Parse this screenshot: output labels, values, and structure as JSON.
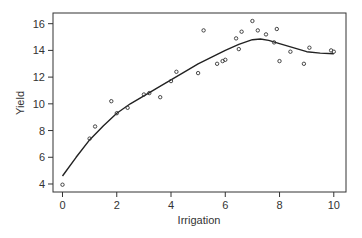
{
  "chart_data": {
    "type": "scatter",
    "title": "",
    "xlabel": "Irrigation",
    "ylabel": "Yield",
    "xlim": [
      -0.35,
      10.45
    ],
    "ylim": [
      3.4,
      16.8
    ],
    "xticks": [
      0,
      2,
      4,
      6,
      8,
      10
    ],
    "yticks": [
      4,
      6,
      8,
      10,
      12,
      14,
      16
    ],
    "grid": false,
    "legend": null,
    "series": [
      {
        "name": "observations",
        "kind": "points",
        "marker": "open-circle",
        "x": [
          0,
          1.0,
          1.2,
          1.8,
          2.0,
          2.4,
          3.0,
          3.2,
          3.6,
          4.0,
          4.2,
          5.0,
          5.2,
          5.7,
          5.9,
          6.0,
          6.4,
          6.5,
          6.6,
          7.0,
          7.2,
          7.5,
          7.8,
          7.9,
          8.0,
          8.4,
          8.9,
          9.1,
          9.9,
          10.0
        ],
        "y": [
          3.95,
          7.4,
          8.3,
          10.2,
          9.3,
          9.7,
          10.7,
          10.8,
          10.5,
          11.7,
          12.4,
          12.3,
          15.5,
          13.0,
          13.2,
          13.3,
          14.9,
          14.1,
          15.4,
          16.2,
          15.5,
          15.2,
          14.6,
          15.6,
          13.2,
          13.9,
          13.0,
          14.2,
          14.0,
          13.9
        ]
      },
      {
        "name": "smooth fit",
        "kind": "line",
        "x": [
          0,
          0.5,
          1,
          1.5,
          2,
          2.5,
          3,
          3.5,
          4,
          4.5,
          5,
          5.5,
          6,
          6.5,
          7,
          7.3,
          7.6,
          8,
          8.5,
          9,
          9.5,
          10
        ],
        "y": [
          4.6,
          6.0,
          7.3,
          8.35,
          9.3,
          10.0,
          10.6,
          11.2,
          11.8,
          12.4,
          13.0,
          13.5,
          14.0,
          14.45,
          14.8,
          14.85,
          14.75,
          14.5,
          14.2,
          13.9,
          13.8,
          13.75
        ]
      }
    ],
    "colors": {
      "axis": "#333333",
      "points": "#333333",
      "line": "#222222",
      "background": "#ffffff"
    }
  }
}
